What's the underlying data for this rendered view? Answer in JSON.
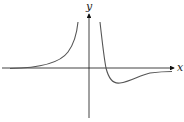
{
  "figure": {
    "type": "function-sketch",
    "axes": {
      "x_label": "x",
      "y_label": "y"
    },
    "curves": [
      {
        "name": "left-branch",
        "description": "rises from horizontal asymptote y=0 toward +infinity near vertical asymptote left of y-axis"
      },
      {
        "name": "right-branch",
        "description": "descends from +infinity right of y-axis, crosses x-axis, reaches minimum, rises back toward y=0"
      }
    ],
    "colors": {
      "axis": "#111111",
      "curve": "#555555"
    }
  }
}
